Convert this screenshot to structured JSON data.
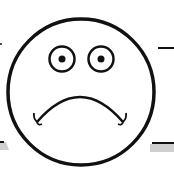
{
  "image": {
    "subject": "sad face",
    "icon": "frowning-face-icon",
    "colors": {
      "stroke": "#111111",
      "background": "#ffffff",
      "shadow": "#c8c8c8"
    }
  }
}
